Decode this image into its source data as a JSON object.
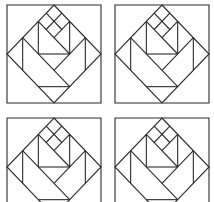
{
  "figure": {
    "stroke_color": "#2a2a2a",
    "background": "#ffffff",
    "blocks": [
      {
        "id": "block-1",
        "position": "top-left"
      },
      {
        "id": "block-2",
        "position": "top-right"
      },
      {
        "id": "block-3",
        "position": "bottom-left"
      },
      {
        "id": "block-4",
        "position": "bottom-right"
      }
    ]
  }
}
